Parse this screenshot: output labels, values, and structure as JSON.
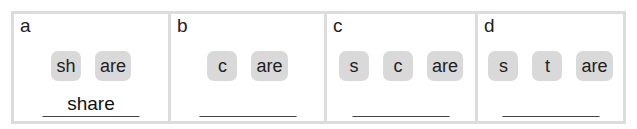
{
  "panels": [
    {
      "letter": "a",
      "tiles": [
        "sh",
        "are"
      ],
      "answer": "share"
    },
    {
      "letter": "b",
      "tiles": [
        "c",
        "are"
      ],
      "answer": ""
    },
    {
      "letter": "c",
      "tiles": [
        "s",
        "c",
        "are"
      ],
      "answer": ""
    },
    {
      "letter": "d",
      "tiles": [
        "s",
        "t",
        "are"
      ],
      "answer": ""
    }
  ],
  "colors": {
    "tile_bg": "#d9d9d9",
    "border": "#dcdcdc",
    "underline": "#444444"
  }
}
